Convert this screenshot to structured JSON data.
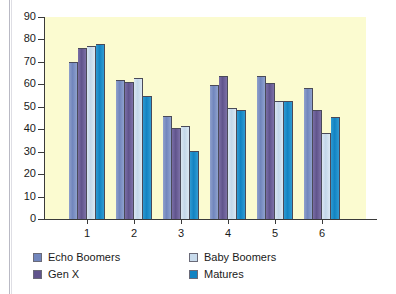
{
  "chart_data": {
    "type": "bar",
    "title": "",
    "xlabel": "",
    "ylabel": "",
    "ylim": [
      0,
      90
    ],
    "yticks": [
      0,
      10,
      20,
      30,
      40,
      50,
      60,
      70,
      80,
      90
    ],
    "grid": false,
    "legend_position": "bottom",
    "categories": [
      "1",
      "2",
      "3",
      "4",
      "5",
      "6"
    ],
    "series": [
      {
        "name": "Echo Boomers",
        "color": "#7186bd",
        "values": [
          70,
          62,
          46,
          59.5,
          63.5,
          58.5
        ]
      },
      {
        "name": "Gen X",
        "color": "#60548c",
        "values": [
          76,
          61,
          40.5,
          63.5,
          60.5,
          48.5
        ]
      },
      {
        "name": "Baby Boomers",
        "color": "#c8dbec",
        "values": [
          77,
          63,
          41.5,
          49.5,
          52.5,
          38.5
        ]
      },
      {
        "name": "Matures",
        "color": "#1283c2",
        "values": [
          78,
          55,
          30.5,
          48.5,
          52.5,
          45.5
        ]
      }
    ],
    "plot_background": "#fbfbd0",
    "page_background": "#ffffff",
    "axis_color": "#3a3a3a"
  }
}
